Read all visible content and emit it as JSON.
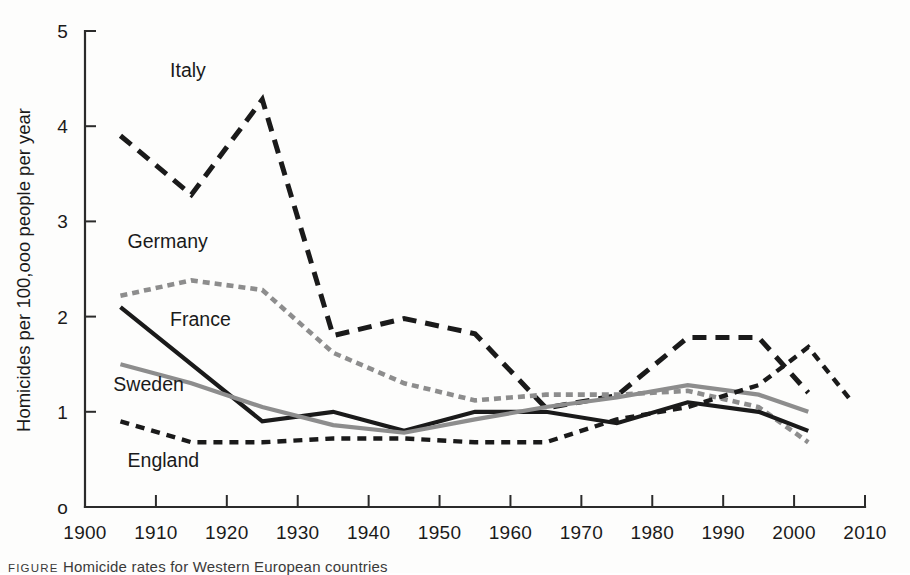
{
  "figure": {
    "caption_tag": "FIGURE",
    "caption_text": "Homicide rates for Western European countries"
  },
  "chart_data": {
    "type": "line",
    "title": "",
    "xlabel": "",
    "ylabel": "Homicides per 100,ooo people per year",
    "xlim": [
      1900,
      2010
    ],
    "ylim": [
      0,
      5
    ],
    "xticks": [
      1900,
      1910,
      1920,
      1930,
      1940,
      1950,
      1960,
      1970,
      1980,
      1990,
      2000,
      2010
    ],
    "yticks": [
      0,
      1,
      2,
      3,
      4,
      5
    ],
    "ytick_labels": [
      "o",
      "1",
      "2",
      "3",
      "4",
      "5"
    ],
    "grid": false,
    "legend": "inline-labels",
    "series": [
      {
        "name": "Italy",
        "color": "#1a1a1a",
        "style": "long-dash",
        "dash": "14,9",
        "width": 5.0,
        "label_x": 1912,
        "label_y": 4.52,
        "x": [
          1905,
          1915,
          1925,
          1935,
          1945,
          1955,
          1965,
          1975,
          1985,
          1995,
          2002
        ],
        "y": [
          3.9,
          3.28,
          4.28,
          1.8,
          1.98,
          1.82,
          1.04,
          1.17,
          1.78,
          1.78,
          1.2
        ]
      },
      {
        "name": "Germany",
        "color": "#8d8d8d",
        "style": "short-dash",
        "dash": "7,5",
        "width": 4.6,
        "label_x": 1906,
        "label_y": 2.72,
        "x": [
          1905,
          1915,
          1925,
          1935,
          1945,
          1955,
          1965,
          1975,
          1985,
          1995,
          2002
        ],
        "y": [
          2.22,
          2.38,
          2.28,
          1.62,
          1.3,
          1.12,
          1.18,
          1.18,
          1.22,
          1.05,
          0.68
        ]
      },
      {
        "name": "France",
        "color": "#1a1a1a",
        "style": "solid",
        "dash": "none",
        "width": 4.2,
        "label_x": 1912,
        "label_y": 1.9,
        "x": [
          1905,
          1925,
          1935,
          1945,
          1955,
          1965,
          1975,
          1985,
          1995,
          2002
        ],
        "y": [
          2.1,
          0.9,
          1.0,
          0.8,
          1.0,
          1.0,
          0.88,
          1.1,
          1.0,
          0.8
        ]
      },
      {
        "name": "Sweden",
        "color": "#8d8d8d",
        "style": "solid",
        "dash": "none",
        "width": 4.2,
        "label_x": 1904,
        "label_y": 1.22,
        "x": [
          1905,
          1915,
          1925,
          1935,
          1945,
          1955,
          1965,
          1975,
          1985,
          1995,
          2002
        ],
        "y": [
          1.5,
          1.3,
          1.05,
          0.86,
          0.78,
          0.92,
          1.05,
          1.15,
          1.28,
          1.18,
          1.0
        ]
      },
      {
        "name": "England",
        "color": "#1a1a1a",
        "style": "dotted-dash",
        "dash": "9,7",
        "width": 4.4,
        "label_x": 1906,
        "label_y": 0.42,
        "x": [
          1905,
          1915,
          1925,
          1935,
          1945,
          1955,
          1965,
          1975,
          1985,
          1995,
          2002,
          2008
        ],
        "y": [
          0.9,
          0.68,
          0.68,
          0.72,
          0.72,
          0.68,
          0.68,
          0.92,
          1.05,
          1.28,
          1.68,
          1.12
        ]
      }
    ]
  }
}
